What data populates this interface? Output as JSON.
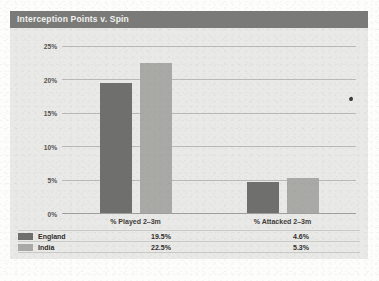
{
  "panel": {
    "title": "Interception Points v. Spin"
  },
  "chart_data": {
    "type": "bar",
    "title": "Interception Points v. Spin",
    "xlabel": "",
    "ylabel": "",
    "categories": [
      "% Played 2–3m",
      "% Attacked 2–3m"
    ],
    "series": [
      {
        "name": "England",
        "color": "#6f6f6d",
        "values": [
          19.5,
          22.5
        ],
        "labels": [
          "19.5%",
          "22.5%"
        ]
      },
      {
        "name": "India",
        "color": "#a9a9a6",
        "values": [
          22.5,
          5.3
        ],
        "labels": [
          "22.5%",
          "5.3%"
        ]
      }
    ],
    "ylim": [
      0,
      25
    ],
    "yticks": [
      0,
      5,
      10,
      15,
      20,
      25
    ],
    "ytick_labels": [
      "0%",
      "5%",
      "10%",
      "15%",
      "20%",
      "25%"
    ],
    "grid": true,
    "legend_position": "bottom-table",
    "value_suffix": "%"
  },
  "table": {
    "rows": [
      {
        "name": "England",
        "values": [
          "19.5%",
          "4.6%"
        ]
      },
      {
        "name": "India",
        "values": [
          "22.5%",
          "5.3%"
        ]
      }
    ]
  },
  "colors": {
    "title_bar": "#7a7a78",
    "panel_bg": "#e9e9e7",
    "series_england": "#6f6f6d",
    "series_india": "#a9a9a6",
    "gridline": "#b9b9b6"
  }
}
